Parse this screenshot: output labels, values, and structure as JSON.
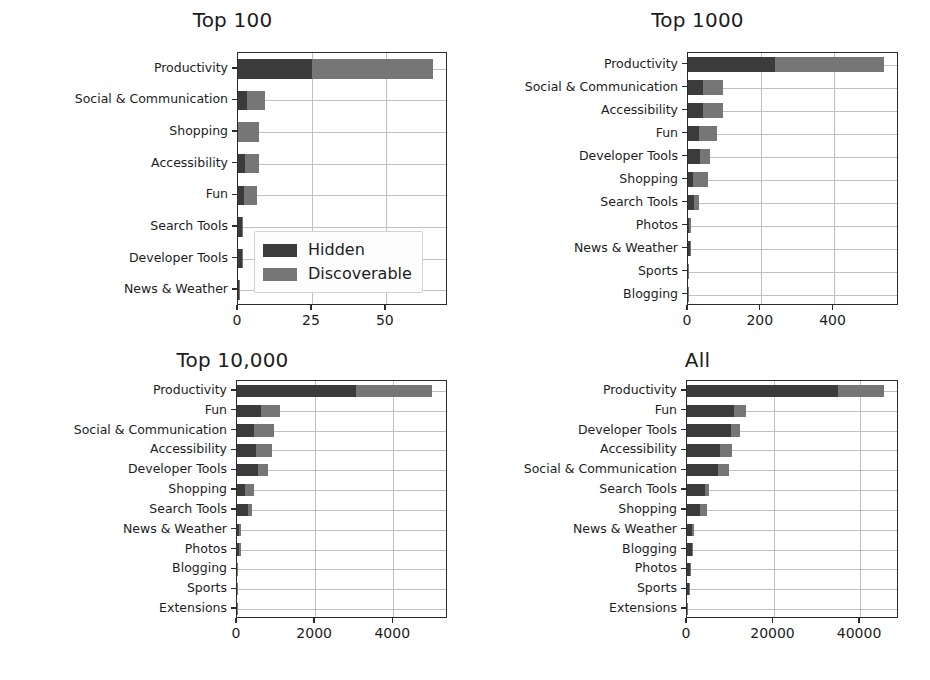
{
  "figure": {
    "background": "#ffffff",
    "width": 930,
    "height": 680
  },
  "colors": {
    "hidden": "#3b3b3b",
    "discoverable": "#767676",
    "axis": "#2b2b2b",
    "grid": "#c0c0c0",
    "text": "#1c1c1c"
  },
  "legend": {
    "position": "center-left of Top 100 panel",
    "entries": [
      {
        "label": "Hidden",
        "color": "#3b3b3b"
      },
      {
        "label": "Discoverable",
        "color": "#767676"
      }
    ]
  },
  "chart_data": [
    {
      "type": "bar",
      "orientation": "horizontal",
      "stacked": true,
      "title": "Top 100",
      "xlabel": "",
      "ylabel": "",
      "xlim": [
        0,
        71
      ],
      "grid": true,
      "xticks": [
        0,
        25,
        50
      ],
      "xticklabels": [
        "0",
        "25",
        "50"
      ],
      "categories": [
        "Productivity",
        "Social & Communication",
        "Shopping",
        "Accessibility",
        "Fun",
        "Search Tools",
        "Developer Tools",
        "News & Weather"
      ],
      "series": [
        {
          "name": "Hidden",
          "values": [
            25,
            3,
            0,
            2.5,
            2,
            1.5,
            1.2,
            0.4
          ]
        },
        {
          "name": "Discoverable",
          "values": [
            41,
            6,
            7,
            4.5,
            4.5,
            0.3,
            0.4,
            0.2
          ]
        }
      ],
      "totals": [
        66,
        9,
        7,
        7,
        6.5,
        1.8,
        1.6,
        0.6
      ]
    },
    {
      "type": "bar",
      "orientation": "horizontal",
      "stacked": true,
      "title": "Top 1000",
      "xlabel": "",
      "ylabel": "",
      "xlim": [
        0,
        580
      ],
      "grid": true,
      "xticks": [
        0,
        200,
        400
      ],
      "xticklabels": [
        "0",
        "200",
        "400"
      ],
      "categories": [
        "Productivity",
        "Social & Communication",
        "Accessibility",
        "Fun",
        "Developer Tools",
        "Shopping",
        "Search Tools",
        "Photos",
        "News & Weather",
        "Sports",
        "Blogging"
      ],
      "series": [
        {
          "name": "Hidden",
          "values": [
            240,
            40,
            42,
            30,
            33,
            14,
            17,
            4,
            5,
            1,
            0.6
          ]
        },
        {
          "name": "Discoverable",
          "values": [
            300,
            57,
            53,
            50,
            27,
            41,
            13,
            4,
            2,
            1,
            0.4
          ]
        }
      ],
      "totals": [
        540,
        97,
        95,
        80,
        60,
        55,
        30,
        8,
        7,
        2,
        1
      ]
    },
    {
      "type": "bar",
      "orientation": "horizontal",
      "stacked": true,
      "title": "Top 10,000",
      "xlabel": "",
      "ylabel": "",
      "xlim": [
        0,
        5400
      ],
      "grid": true,
      "xticks": [
        0,
        2000,
        4000
      ],
      "xticklabels": [
        "0",
        "2000",
        "4000"
      ],
      "categories": [
        "Productivity",
        "Fun",
        "Social & Communication",
        "Accessibility",
        "Developer Tools",
        "Shopping",
        "Search Tools",
        "News & Weather",
        "Photos",
        "Blogging",
        "Sports",
        "Extensions"
      ],
      "series": [
        {
          "name": "Hidden",
          "values": [
            3050,
            620,
            430,
            480,
            540,
            200,
            290,
            60,
            40,
            12,
            8,
            2
          ]
        },
        {
          "name": "Discoverable",
          "values": [
            1950,
            480,
            520,
            420,
            260,
            230,
            90,
            40,
            50,
            10,
            6,
            2
          ]
        }
      ],
      "totals": [
        5000,
        1100,
        950,
        900,
        800,
        430,
        380,
        100,
        90,
        22,
        14,
        4
      ]
    },
    {
      "type": "bar",
      "orientation": "horizontal",
      "stacked": true,
      "title": "All",
      "xlabel": "",
      "ylabel": "",
      "xlim": [
        0,
        49000
      ],
      "grid": true,
      "xticks": [
        0,
        20000,
        40000
      ],
      "xticklabels": [
        "0",
        "20000",
        "40000"
      ],
      "categories": [
        "Productivity",
        "Fun",
        "Developer Tools",
        "Accessibility",
        "Social & Communication",
        "Search Tools",
        "Shopping",
        "News & Weather",
        "Blogging",
        "Photos",
        "Sports",
        "Extensions"
      ],
      "series": [
        {
          "name": "Hidden",
          "values": [
            35000,
            10800,
            10200,
            7600,
            7200,
            4200,
            3100,
            1200,
            1100,
            700,
            500,
            90
          ]
        },
        {
          "name": "Discoverable",
          "values": [
            10600,
            2900,
            2000,
            2800,
            2600,
            1000,
            1600,
            500,
            300,
            300,
            200,
            60
          ]
        }
      ],
      "totals": [
        45600,
        13700,
        12200,
        10400,
        9800,
        5200,
        4700,
        1700,
        1400,
        1000,
        700,
        150
      ]
    }
  ]
}
